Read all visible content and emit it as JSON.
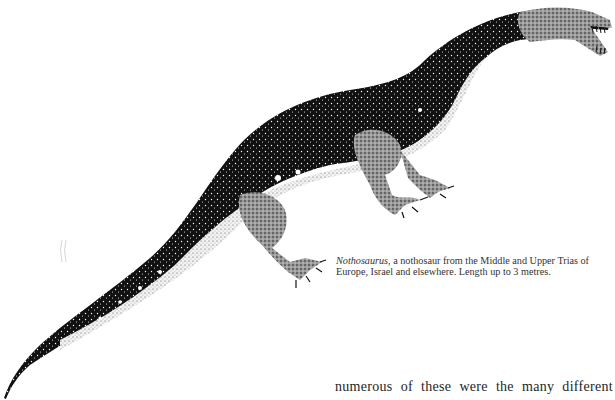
{
  "figure": {
    "icon": "reptile-illustration",
    "colors": {
      "ink": "#111111",
      "paper": "#ffffff",
      "belly": "#e8e8e8"
    }
  },
  "caption": {
    "genus": "Nothosaurus",
    "text": ", a nothosaur from the Middle and Upper Trias of Europe, Israel and elsewhere. Length up to 3 metres."
  },
  "body": {
    "line": "numerous of these were the many different"
  }
}
